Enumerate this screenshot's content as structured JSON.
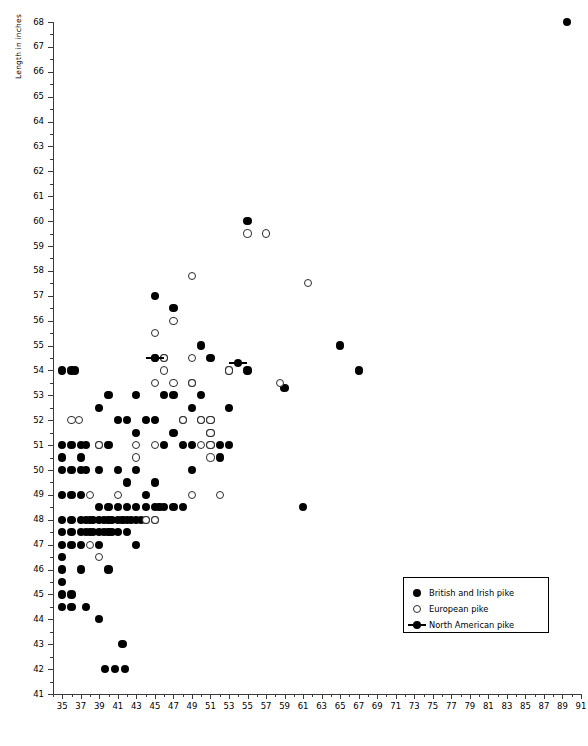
{
  "chart_data": {
    "type": "scatter",
    "title": "",
    "xlabel": "",
    "ylabel": "Length in inches",
    "xlim": [
      34,
      91
    ],
    "ylim": [
      41,
      68
    ],
    "grid": false,
    "legend_position": "lower-right",
    "x_ticks": [
      35,
      37,
      39,
      41,
      43,
      45,
      47,
      49,
      51,
      53,
      55,
      57,
      59,
      61,
      63,
      65,
      67,
      69,
      71,
      73,
      75,
      77,
      79,
      81,
      83,
      85,
      87,
      89,
      91
    ],
    "y_ticks": [
      41,
      42,
      43,
      44,
      45,
      46,
      47,
      48,
      49,
      50,
      51,
      52,
      53,
      54,
      55,
      56,
      57,
      58,
      59,
      60,
      61,
      62,
      63,
      64,
      65,
      66,
      67,
      68
    ],
    "series": [
      {
        "name": "British and Irish pike",
        "marker": "filled-circle",
        "color": "#000000",
        "points": [
          [
            35,
            54
          ],
          [
            36,
            54
          ],
          [
            36.4,
            54
          ],
          [
            35,
            51
          ],
          [
            35,
            50.5
          ],
          [
            35,
            50
          ],
          [
            35,
            49
          ],
          [
            35,
            48
          ],
          [
            35,
            47.5
          ],
          [
            35,
            47
          ],
          [
            35,
            46.5
          ],
          [
            35,
            46
          ],
          [
            35,
            45.5
          ],
          [
            35,
            45
          ],
          [
            35,
            44.5
          ],
          [
            36,
            51
          ],
          [
            36,
            50
          ],
          [
            36,
            49
          ],
          [
            36,
            48
          ],
          [
            36,
            47.5
          ],
          [
            36,
            47
          ],
          [
            36,
            45
          ],
          [
            36,
            44.5
          ],
          [
            37,
            51
          ],
          [
            37,
            50.5
          ],
          [
            37,
            50
          ],
          [
            37,
            49
          ],
          [
            37,
            48
          ],
          [
            37,
            47.5
          ],
          [
            37,
            47
          ],
          [
            37,
            46
          ],
          [
            37.6,
            51
          ],
          [
            37.6,
            50
          ],
          [
            37.6,
            48
          ],
          [
            37.6,
            47.5
          ],
          [
            37.6,
            44.5
          ],
          [
            38,
            48
          ],
          [
            38,
            47.5
          ],
          [
            38.3,
            48
          ],
          [
            38.3,
            47.5
          ],
          [
            39,
            52.5
          ],
          [
            39,
            51
          ],
          [
            39,
            50
          ],
          [
            39,
            48.5
          ],
          [
            39,
            48
          ],
          [
            39,
            47.5
          ],
          [
            39,
            47
          ],
          [
            39,
            44
          ],
          [
            39.5,
            48
          ],
          [
            39.5,
            47.5
          ],
          [
            39.6,
            42
          ],
          [
            40,
            53
          ],
          [
            40,
            51
          ],
          [
            40,
            48.5
          ],
          [
            40,
            48
          ],
          [
            40,
            47.5
          ],
          [
            40,
            46
          ],
          [
            40.4,
            48
          ],
          [
            40.4,
            47.5
          ],
          [
            40.7,
            42
          ],
          [
            41,
            52
          ],
          [
            41,
            50
          ],
          [
            41,
            48.5
          ],
          [
            41,
            48
          ],
          [
            41,
            47.5
          ],
          [
            41.5,
            48
          ],
          [
            41.5,
            43
          ],
          [
            41.8,
            42
          ],
          [
            42,
            52
          ],
          [
            42,
            49.5
          ],
          [
            42,
            48.5
          ],
          [
            42,
            48
          ],
          [
            42,
            47.5
          ],
          [
            42.4,
            48
          ],
          [
            43,
            53
          ],
          [
            43,
            51.5
          ],
          [
            43,
            50
          ],
          [
            43,
            48.5
          ],
          [
            43,
            48
          ],
          [
            43,
            47
          ],
          [
            43.5,
            48
          ],
          [
            44,
            52
          ],
          [
            44,
            49
          ],
          [
            44,
            48.5
          ],
          [
            44,
            48
          ],
          [
            45,
            57
          ],
          [
            45,
            54.5
          ],
          [
            45,
            52
          ],
          [
            45,
            49.5
          ],
          [
            45,
            48.5
          ],
          [
            45,
            48
          ],
          [
            45.5,
            48.5
          ],
          [
            46,
            54.5
          ],
          [
            46,
            53
          ],
          [
            46,
            51
          ],
          [
            46,
            48.5
          ],
          [
            47,
            56.5
          ],
          [
            47,
            53
          ],
          [
            47,
            51.5
          ],
          [
            47,
            48.5
          ],
          [
            48,
            52
          ],
          [
            48,
            51
          ],
          [
            48,
            48.5
          ],
          [
            49,
            53.5
          ],
          [
            49,
            52.5
          ],
          [
            49,
            51
          ],
          [
            49,
            50
          ],
          [
            50,
            55
          ],
          [
            50,
            53
          ],
          [
            50,
            52
          ],
          [
            51,
            54.5
          ],
          [
            51,
            52
          ],
          [
            51,
            51.5
          ],
          [
            51,
            51
          ],
          [
            52,
            51
          ],
          [
            52,
            50.5
          ],
          [
            53,
            54
          ],
          [
            53,
            52.5
          ],
          [
            53,
            51
          ],
          [
            55,
            60
          ],
          [
            55,
            54
          ],
          [
            59,
            53.3
          ],
          [
            61,
            48.5
          ],
          [
            65,
            55
          ],
          [
            67,
            54
          ],
          [
            89.5,
            68
          ]
        ]
      },
      {
        "name": "European pike",
        "marker": "open-circle",
        "color": "#ffffff",
        "points": [
          [
            36,
            52
          ],
          [
            36.8,
            52
          ],
          [
            38,
            49
          ],
          [
            38,
            47
          ],
          [
            39,
            51
          ],
          [
            39,
            46.5
          ],
          [
            41,
            49
          ],
          [
            43,
            51
          ],
          [
            43,
            50.5
          ],
          [
            44,
            48
          ],
          [
            45,
            55.5
          ],
          [
            45,
            53.5
          ],
          [
            45,
            51
          ],
          [
            45,
            48
          ],
          [
            46,
            54.5
          ],
          [
            46,
            54
          ],
          [
            47,
            56
          ],
          [
            47,
            53.5
          ],
          [
            48,
            52
          ],
          [
            49,
            57.8
          ],
          [
            49,
            54.5
          ],
          [
            49,
            53.5
          ],
          [
            49,
            49
          ],
          [
            50,
            52
          ],
          [
            50,
            51
          ],
          [
            51,
            52
          ],
          [
            51,
            51.5
          ],
          [
            51,
            51
          ],
          [
            51,
            50.5
          ],
          [
            52,
            49
          ],
          [
            53,
            54
          ],
          [
            55,
            59.5
          ],
          [
            57,
            59.5
          ],
          [
            58.5,
            53.5
          ],
          [
            61.5,
            57.5
          ]
        ]
      },
      {
        "name": "North American pike",
        "marker": "filled-circle-with-bar",
        "color": "#000000",
        "points": [
          [
            45,
            54.5
          ],
          [
            54,
            54.3
          ]
        ]
      }
    ]
  },
  "legend": {
    "entries": [
      {
        "label": "British and Irish pike",
        "marker": "filled-circle"
      },
      {
        "label": "European pike",
        "marker": "open-circle"
      },
      {
        "label": "North American pike",
        "marker": "filled-circle-with-bar"
      }
    ]
  }
}
